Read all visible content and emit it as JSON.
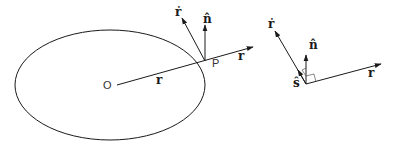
{
  "figure": {
    "left_panel": {
      "origin_label": "O",
      "point_label": "P",
      "position_vector_label": "r",
      "position_vector_extension_label": "r",
      "velocity_label": "ṙ",
      "normal_label": "n̂"
    },
    "right_panel": {
      "velocity_label": "ṙ",
      "normal_label": "n̂",
      "tangent_label": "ŝ",
      "position_vector_label": "r"
    },
    "colors": {
      "stroke": "#1a1a1a",
      "background": "#ffffff"
    }
  }
}
